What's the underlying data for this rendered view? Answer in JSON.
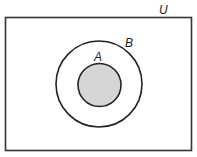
{
  "diagram": {
    "type": "venn",
    "universe": {
      "label": "U",
      "x": 5.5,
      "y": 17.5,
      "width": 186,
      "height": 133,
      "stroke": "#333333"
    },
    "sets": [
      {
        "label": "B",
        "cx": 99,
        "cy": 84,
        "r": 43,
        "fill": "none",
        "stroke": "#222222"
      },
      {
        "label": "A",
        "cx": 99.5,
        "cy": 85,
        "r": 21.5,
        "fill": "#d6d6d6",
        "stroke": "#222222"
      }
    ],
    "relation": "A is a subset of B; B is a subset of U",
    "shaded": "A"
  }
}
